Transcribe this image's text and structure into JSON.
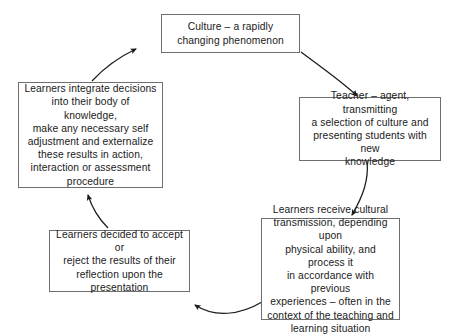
{
  "diagram": {
    "type": "cycle",
    "direction": "counter-clockwise",
    "background_color": "#ffffff",
    "border_color": "#6e6e6e",
    "text_color": "#1a1a1a",
    "nodes": [
      {
        "id": "culture",
        "label": "Culture – a rapidly\nchanging phenomenon",
        "position": "top-center"
      },
      {
        "id": "teacher",
        "label": "Teacher – agent, transmitting\na selection of culture and\npresenting students with new\nknowledge",
        "position": "right"
      },
      {
        "id": "receive",
        "label": "Learners receive cultural\ntransmission, depending upon\nphysical ability, and process it\nin accordance with previous\nexperiences – often in the\ncontext of the teaching and\nlearning situation",
        "position": "bottom-right"
      },
      {
        "id": "decide",
        "label": "Learners decided to accept or\nreject the results of their\nreflection upon the\npresentation",
        "position": "bottom-left"
      },
      {
        "id": "integrate",
        "label": "Learners integrate decisions\ninto their body of knowledge,\nmake any necessary self\nadjustment and externalize\nthese results in action,\ninteraction or assessment\nprocedure",
        "position": "left"
      }
    ],
    "arrows": [
      {
        "id": "culture-to-teacher",
        "from": "culture",
        "to": "teacher",
        "style": "curved"
      },
      {
        "id": "teacher-to-receive",
        "from": "teacher",
        "to": "receive",
        "style": "curved"
      },
      {
        "id": "receive-to-decide",
        "from": "receive",
        "to": "decide",
        "style": "curved"
      },
      {
        "id": "decide-to-integrate",
        "from": "decide",
        "to": "integrate",
        "style": "curved"
      },
      {
        "id": "integrate-to-culture",
        "from": "integrate",
        "to": "culture",
        "style": "curved"
      }
    ]
  }
}
